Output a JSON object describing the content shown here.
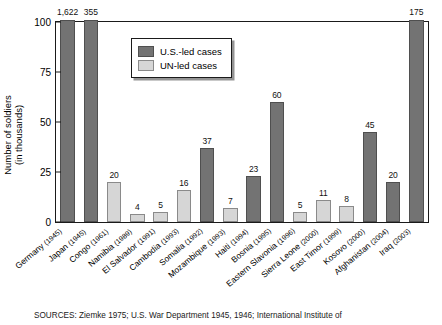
{
  "chart_data": {
    "type": "bar",
    "title": "",
    "xlabel": "",
    "ylabel": "Number of soldiers (in thousands)",
    "ylabel_line1": "Number of soldiers",
    "ylabel_line2": "(in thousands)",
    "ylim": [
      0,
      100
    ],
    "yticks": [
      0,
      25,
      50,
      75,
      100
    ],
    "ytick_labels": [
      "0",
      "25",
      "50",
      "75",
      "100"
    ],
    "grid": false,
    "legend_position": "upper center inside",
    "note": "Bars for Germany, Japan and Iraq exceed the 100 axis maximum and are clipped; their true values are shown as data labels.",
    "series": [
      {
        "name": "U.S.-led cases",
        "color": "#737373"
      },
      {
        "name": "UN-led cases",
        "color": "#d6d6d6"
      }
    ],
    "categories": [
      "Germany (1945)",
      "Japan (1945)",
      "Congo (1961)",
      "Namibia (1989)",
      "El Salvador (1991)",
      "Cambodia (1993)",
      "Somalia (1992)",
      "Mozambique (1993)",
      "Haiti (1994)",
      "Bosnia (1995)",
      "Eastern Slavonia (1996)",
      "Sierra Leone (2000)",
      "East Timor (1999)",
      "Kosovo (2000)",
      "Afghanistan (2004)",
      "Iraq (2003)"
    ],
    "points": [
      {
        "country": "Germany",
        "year": "1945",
        "value": 1622,
        "label": "1,622",
        "series": "U.S.-led cases",
        "clipped": true
      },
      {
        "country": "Japan",
        "year": "1945",
        "value": 355,
        "label": "355",
        "series": "U.S.-led cases",
        "clipped": true
      },
      {
        "country": "Congo",
        "year": "1961",
        "value": 20,
        "label": "20",
        "series": "UN-led cases",
        "clipped": false
      },
      {
        "country": "Namibia",
        "year": "1989",
        "value": 4,
        "label": "4",
        "series": "UN-led cases",
        "clipped": false
      },
      {
        "country": "El Salvador",
        "year": "1991",
        "value": 5,
        "label": "5",
        "series": "UN-led cases",
        "clipped": false
      },
      {
        "country": "Cambodia",
        "year": "1993",
        "value": 16,
        "label": "16",
        "series": "UN-led cases",
        "clipped": false
      },
      {
        "country": "Somalia",
        "year": "1992",
        "value": 37,
        "label": "37",
        "series": "U.S.-led cases",
        "clipped": false
      },
      {
        "country": "Mozambique",
        "year": "1993",
        "value": 7,
        "label": "7",
        "series": "UN-led cases",
        "clipped": false
      },
      {
        "country": "Haiti",
        "year": "1994",
        "value": 23,
        "label": "23",
        "series": "U.S.-led cases",
        "clipped": false
      },
      {
        "country": "Bosnia",
        "year": "1995",
        "value": 60,
        "label": "60",
        "series": "U.S.-led cases",
        "clipped": false
      },
      {
        "country": "Eastern Slavonia",
        "year": "1996",
        "value": 5,
        "label": "5",
        "series": "UN-led cases",
        "clipped": false
      },
      {
        "country": "Sierra Leone",
        "year": "2000",
        "value": 11,
        "label": "11",
        "series": "UN-led cases",
        "clipped": false
      },
      {
        "country": "East Timor",
        "year": "1999",
        "value": 8,
        "label": "8",
        "series": "UN-led cases",
        "clipped": false
      },
      {
        "country": "Kosovo",
        "year": "2000",
        "value": 45,
        "label": "45",
        "series": "U.S.-led cases",
        "clipped": false
      },
      {
        "country": "Afghanistan",
        "year": "2004",
        "value": 20,
        "label": "20",
        "series": "U.S.-led cases",
        "clipped": false
      },
      {
        "country": "Iraq",
        "year": "2003",
        "value": 175,
        "label": "175",
        "series": "U.S.-led cases",
        "clipped": true
      }
    ]
  },
  "legend": {
    "items": [
      {
        "label": "U.S.-led cases",
        "key": "us"
      },
      {
        "label": "UN-led cases",
        "key": "un"
      }
    ]
  },
  "source": {
    "text": "SOURCES: Ziemke 1975; U.S. War Department 1945, 1946; International Institute of"
  }
}
